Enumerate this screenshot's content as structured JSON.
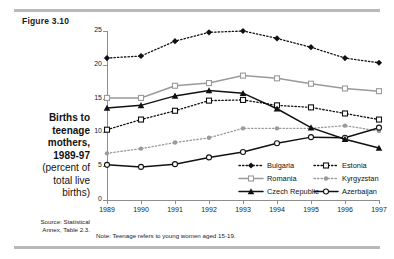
{
  "figure_label": "Figure 3.10",
  "caption": {
    "line1": "Births to",
    "line2": "teenage",
    "line3": "mothers,",
    "line4": "1989-97",
    "line5": "(percent of",
    "line6": "total live",
    "line7": "births)"
  },
  "source": {
    "line1": "Source: Statistical",
    "line2": "Annex, Table 2.3."
  },
  "note": "Note: Teenage refers to young women aged 15-19.",
  "legend": [
    {
      "label": "Bulgaria",
      "marker": "filled-diamond",
      "line": "dotted",
      "color": "#111111"
    },
    {
      "label": "Estonia",
      "marker": "open-square",
      "line": "dotted",
      "color": "#111111"
    },
    {
      "label": "Romania",
      "marker": "open-square",
      "line": "solid",
      "color": "#9a9a9a"
    },
    {
      "label": "Kyrgyzstan",
      "marker": "filled-dot",
      "line": "dotted",
      "color": "#9a9a9a"
    },
    {
      "label": "Czech Republic",
      "marker": "filled-triangle",
      "line": "solid",
      "color": "#111111"
    },
    {
      "label": "Azerbaijan",
      "marker": "open-circle",
      "line": "solid",
      "color": "#111111"
    }
  ],
  "chart_data": {
    "type": "line",
    "title": "Births to teenage mothers, 1989-97 (percent of total live births)",
    "xlabel": "",
    "ylabel": "",
    "categories": [
      "1989",
      "1990",
      "1991",
      "1992",
      "1993",
      "1994",
      "1995",
      "1996",
      "1997"
    ],
    "yticks": [
      0,
      5,
      10,
      15,
      20,
      25
    ],
    "ylim": [
      0,
      25
    ],
    "grid": false,
    "legend_position": "inside-bottom-right",
    "series": [
      {
        "name": "Bulgaria",
        "values": [
          21.0,
          21.3,
          23.5,
          24.8,
          25.0,
          23.9,
          22.6,
          21.0,
          20.3
        ]
      },
      {
        "name": "Romania",
        "values": [
          15.1,
          15.1,
          16.9,
          17.3,
          18.4,
          18.0,
          17.2,
          16.5,
          16.1
        ]
      },
      {
        "name": "Czech Republic",
        "values": [
          13.6,
          14.0,
          15.4,
          16.2,
          15.8,
          13.5,
          10.7,
          9.0,
          7.7
        ]
      },
      {
        "name": "Estonia",
        "values": [
          10.4,
          11.9,
          13.2,
          14.7,
          14.8,
          14.0,
          13.7,
          12.8,
          11.9
        ]
      },
      {
        "name": "Kyrgyzstan",
        "values": [
          6.9,
          7.6,
          8.5,
          9.2,
          10.6,
          10.6,
          10.6,
          11.0,
          10.2
        ]
      },
      {
        "name": "Azerbaijan",
        "values": [
          5.2,
          4.9,
          5.3,
          6.3,
          7.1,
          8.4,
          9.3,
          9.2,
          10.7
        ]
      }
    ]
  }
}
